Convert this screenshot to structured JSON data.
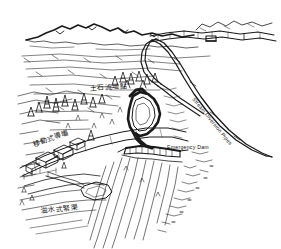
{
  "figure": {
    "kind": "hand-drawn perspective landscape sketch",
    "background_color": "#ffffff",
    "ink_color": "#1a1a1a",
    "width": 281,
    "height": 249
  },
  "labels": {
    "emergency_dam": "Emergency Dam",
    "stream_diversion_pipes": "Stream Diversion Pipes",
    "debris_flow_site": "土石流地點",
    "mobile_dam": "移動式導壩",
    "overflow_channel": "溢水式緊渠"
  },
  "scene": {
    "ridge_label": "distant mountain ridge",
    "valley_label": "upper valley slope",
    "basin_label": "debris retention basin",
    "channel_label": "hatched river channel",
    "trees_label": "conifer tree cluster",
    "buildings_label": "terrace buildings",
    "road_label": "access road",
    "pipes_label": "diversion pipeline"
  }
}
